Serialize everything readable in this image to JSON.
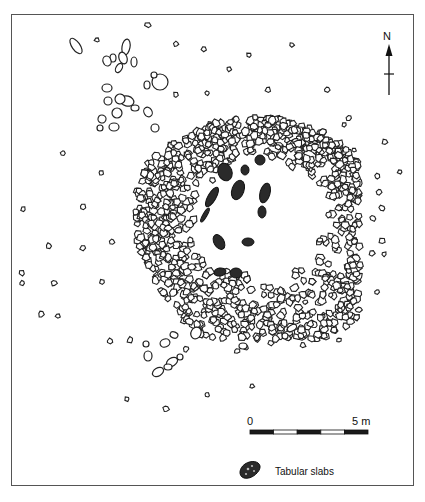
{
  "figure": {
    "type": "archaeological site plan"
  },
  "north_arrow": {
    "label": "N",
    "x": 389,
    "top": 44,
    "bottom": 95,
    "crossbar_y": 74
  },
  "scale_bar": {
    "start_label": "0",
    "end_label": "5 m",
    "x0": 250,
    "x1": 368,
    "y": 430,
    "segments": 5,
    "colors": [
      "#1a1a1a",
      "#ffffff",
      "#1a1a1a",
      "#ffffff",
      "#1a1a1a"
    ]
  },
  "legend": {
    "items": [
      {
        "symbol": "tabular-slab",
        "label": "Tabular slabs"
      }
    ]
  },
  "colors": {
    "stone_stroke": "#222222",
    "slab_fill": "#2a2a2a",
    "frame": "#555555"
  },
  "ring": {
    "cx": 262,
    "cy": 225,
    "rx_outer": 128,
    "ry_outer": 118,
    "rx_inner": 62,
    "ry_inner": 56,
    "offset_y_inner": -8
  },
  "slabs": [
    [
      225,
      172,
      7,
      9,
      -20
    ],
    [
      238,
      190,
      6,
      10,
      20
    ],
    [
      265,
      193,
      5,
      10,
      15
    ],
    [
      260,
      160,
      5,
      5,
      0
    ],
    [
      212,
      197,
      4,
      11,
      30
    ],
    [
      245,
      170,
      4,
      5,
      0
    ],
    [
      219,
      242,
      5,
      8,
      -30
    ],
    [
      205,
      215,
      2,
      8,
      30
    ],
    [
      248,
      242,
      6,
      4,
      0
    ],
    [
      236,
      273,
      6,
      5,
      0
    ],
    [
      220,
      272,
      6,
      4,
      -10
    ],
    [
      262,
      212,
      4,
      6,
      0
    ]
  ],
  "scattered_stones": [
    [
      148,
      25,
      3
    ],
    [
      97,
      40,
      2.5
    ],
    [
      176,
      44,
      2.5
    ],
    [
      204,
      49,
      3
    ],
    [
      292,
      45,
      2.5
    ],
    [
      249,
      55,
      2.5
    ],
    [
      229,
      69,
      2.5
    ],
    [
      207,
      93,
      2.5
    ],
    [
      176,
      95,
      3
    ],
    [
      268,
      90,
      3
    ],
    [
      327,
      90,
      3
    ],
    [
      385,
      142,
      3
    ],
    [
      349,
      118,
      3
    ],
    [
      400,
      172,
      2.5
    ],
    [
      377,
      176,
      3
    ],
    [
      379,
      192,
      3
    ],
    [
      382,
      208,
      3
    ],
    [
      373,
      218,
      3
    ],
    [
      382,
      241,
      3
    ],
    [
      372,
      253,
      3
    ],
    [
      384,
      254,
      2.5
    ],
    [
      349,
      271,
      3
    ],
    [
      377,
      292,
      2.5
    ],
    [
      331,
      295,
      2.5
    ],
    [
      23,
      209,
      2.5
    ],
    [
      49,
      246,
      3
    ],
    [
      83,
      207,
      3
    ],
    [
      83,
      248,
      3
    ],
    [
      112,
      242,
      3
    ],
    [
      22,
      273,
      3
    ],
    [
      22,
      283,
      2.5
    ],
    [
      54,
      283,
      3
    ],
    [
      102,
      282,
      2.5
    ],
    [
      41,
      314,
      3
    ],
    [
      58,
      316,
      2.5
    ],
    [
      110,
      341,
      3
    ],
    [
      130,
      340,
      3
    ],
    [
      127,
      399,
      2.5
    ],
    [
      166,
      409,
      3
    ],
    [
      207,
      395,
      2.5
    ],
    [
      252,
      386,
      2.5
    ],
    [
      186,
      349,
      3
    ],
    [
      237,
      351,
      3
    ],
    [
      271,
      343,
      3
    ],
    [
      257,
      338,
      3
    ],
    [
      301,
      336,
      3
    ],
    [
      246,
      348,
      2.5
    ],
    [
      63,
      153,
      2.5
    ],
    [
      101,
      173,
      2.5
    ],
    [
      320,
      240,
      2.5
    ],
    [
      303,
      345,
      3
    ],
    [
      289,
      330,
      2.5
    ],
    [
      344,
      125,
      2.5
    ],
    [
      354,
      150,
      2.5
    ],
    [
      345,
      160,
      3
    ],
    [
      339,
      340,
      2.5
    ],
    [
      305,
      302,
      2.5
    ],
    [
      340,
      310,
      2.5
    ]
  ],
  "large_outline_stones": [
    [
      76,
      46,
      4,
      9,
      -35
    ],
    [
      126,
      47,
      4,
      8,
      10
    ],
    [
      123,
      58,
      4,
      6,
      -20
    ],
    [
      134,
      62,
      3,
      5,
      0
    ],
    [
      113,
      58,
      3,
      4,
      0
    ],
    [
      107,
      61,
      4,
      5,
      -20
    ],
    [
      119,
      68,
      3,
      5,
      30
    ],
    [
      160,
      82,
      8,
      8,
      0
    ],
    [
      147,
      85,
      3,
      4,
      0
    ],
    [
      154,
      75,
      3,
      3,
      0
    ],
    [
      107,
      88,
      5,
      4,
      0
    ],
    [
      127,
      101,
      7,
      5,
      15
    ],
    [
      117,
      113,
      5,
      5,
      0
    ],
    [
      120,
      99,
      5,
      5,
      10
    ],
    [
      108,
      101,
      4,
      4,
      0
    ],
    [
      102,
      119,
      4,
      4,
      20
    ],
    [
      148,
      112,
      4,
      5,
      -30
    ],
    [
      114,
      127,
      5,
      4,
      0
    ],
    [
      155,
      128,
      4,
      4,
      0
    ],
    [
      100,
      128,
      3,
      3,
      0
    ],
    [
      135,
      108,
      4,
      3,
      0
    ],
    [
      165,
      343,
      5,
      4,
      -20
    ],
    [
      174,
      335,
      4,
      3,
      20
    ],
    [
      196,
      333,
      5,
      6,
      30
    ],
    [
      148,
      356,
      4,
      5,
      0
    ],
    [
      172,
      362,
      6,
      4,
      -30
    ],
    [
      180,
      357,
      3,
      3,
      0
    ],
    [
      158,
      372,
      6,
      4,
      -30
    ],
    [
      168,
      367,
      4,
      3,
      0
    ],
    [
      243,
      346,
      4,
      3,
      0
    ],
    [
      292,
      328,
      5,
      3,
      -30
    ],
    [
      285,
      336,
      3,
      3,
      0
    ],
    [
      146,
      344,
      3,
      3,
      0
    ]
  ]
}
